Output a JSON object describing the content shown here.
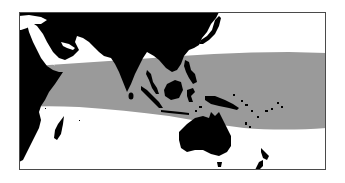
{
  "map": {
    "type": "distribution-range-map",
    "region": "Indian Ocean and Western Pacific",
    "colors": {
      "sea": "#ffffff",
      "land": "#000000",
      "range": "#9a9a9a",
      "frame": "#4a4a4a"
    },
    "layers": [
      {
        "name": "land",
        "color": "#000000"
      },
      {
        "name": "distribution-range",
        "color": "#9a9a9a"
      }
    ]
  }
}
